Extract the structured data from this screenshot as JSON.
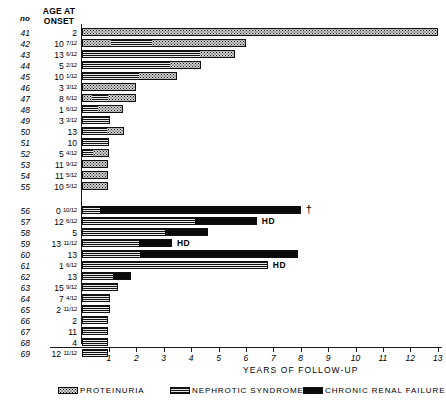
{
  "header": {
    "col_no": "no",
    "col_age_line1": "AGE AT",
    "col_age_line2": "ONSET"
  },
  "axis": {
    "title": "YEARS OF FOLLOW-UP",
    "ticks": [
      "1",
      "2",
      "3",
      "4",
      "5",
      "6",
      "7",
      "8",
      "9",
      "10",
      "11",
      "12",
      "13"
    ]
  },
  "legend": [
    {
      "key": "proteinuria",
      "label": "PROTEINURIA"
    },
    {
      "key": "nephrotic",
      "label": "NEPHROTIC SYNDROME"
    },
    {
      "key": "crf",
      "label": "CHRONIC RENAL FAILURE"
    }
  ],
  "rows": [
    {
      "no": "41",
      "age": "2",
      "frac": "",
      "note": ""
    },
    {
      "no": "42",
      "age": "10",
      "frac": "7/12",
      "note": ""
    },
    {
      "no": "43",
      "age": "13",
      "frac": "6/12",
      "note": ""
    },
    {
      "no": "44",
      "age": "5",
      "frac": "2/12",
      "note": ""
    },
    {
      "no": "45",
      "age": "10",
      "frac": "1/12",
      "note": ""
    },
    {
      "no": "46",
      "age": "3",
      "frac": "3/12",
      "note": ""
    },
    {
      "no": "47",
      "age": "8",
      "frac": "6/12",
      "note": ""
    },
    {
      "no": "48",
      "age": "1",
      "frac": "6/12",
      "note": ""
    },
    {
      "no": "49",
      "age": "3",
      "frac": "3/12",
      "note": ""
    },
    {
      "no": "50",
      "age": "13",
      "frac": "",
      "note": ""
    },
    {
      "no": "51",
      "age": "10",
      "frac": "",
      "note": ""
    },
    {
      "no": "52",
      "age": "5",
      "frac": "4/12",
      "note": ""
    },
    {
      "no": "53",
      "age": "11",
      "frac": "9/12",
      "note": ""
    },
    {
      "no": "54",
      "age": "11",
      "frac": "5/12",
      "note": ""
    },
    {
      "no": "55",
      "age": "10",
      "frac": "5/12",
      "note": ""
    },
    {
      "no": "56",
      "age": "0",
      "frac": "10/12",
      "note": "†"
    },
    {
      "no": "57",
      "age": "12",
      "frac": "6/12",
      "note": "HD"
    },
    {
      "no": "58",
      "age": "5",
      "frac": "",
      "note": ""
    },
    {
      "no": "59",
      "age": "13",
      "frac": "11/12",
      "note": "HD"
    },
    {
      "no": "60",
      "age": "13",
      "frac": "",
      "note": ""
    },
    {
      "no": "61",
      "age": "1",
      "frac": "6/12",
      "note": "HD"
    },
    {
      "no": "62",
      "age": "13",
      "frac": "",
      "note": ""
    },
    {
      "no": "63",
      "age": "15",
      "frac": "9/12",
      "note": ""
    },
    {
      "no": "64",
      "age": "7",
      "frac": "4/12",
      "note": ""
    },
    {
      "no": "65",
      "age": "2",
      "frac": "11/12",
      "note": ""
    },
    {
      "no": "66",
      "age": "2",
      "frac": "",
      "note": ""
    },
    {
      "no": "67",
      "age": "11",
      "frac": "",
      "note": ""
    },
    {
      "no": "68",
      "age": "4",
      "frac": "",
      "note": ""
    },
    {
      "no": "69",
      "age": "12",
      "frac": "11/12",
      "note": ""
    }
  ],
  "chart_data": {
    "type": "bar",
    "orientation": "horizontal",
    "stacked": true,
    "title": "",
    "xlabel": "YEARS OF FOLLOW-UP",
    "ylabel": "",
    "xlim": [
      0,
      13.2
    ],
    "xticks": [
      1,
      2,
      3,
      4,
      5,
      6,
      7,
      8,
      9,
      10,
      11,
      12,
      13
    ],
    "grid": false,
    "legend_position": "bottom",
    "categories": [
      "41",
      "42",
      "43",
      "44",
      "45",
      "46",
      "47",
      "48",
      "49",
      "50",
      "51",
      "52",
      "53",
      "54",
      "55",
      "56",
      "57",
      "58",
      "59",
      "60",
      "61",
      "62",
      "63",
      "64",
      "65",
      "66",
      "67",
      "68",
      "69"
    ],
    "stage_keys": [
      "proteinuria",
      "nephrotic",
      "crf"
    ],
    "stage_labels": [
      "PROTEINURIA",
      "NEPHROTIC SYNDROME",
      "CHRONIC RENAL FAILURE"
    ],
    "bars": [
      {
        "no": "41",
        "total": 13.0,
        "segments": [
          {
            "stage": "proteinuria",
            "start": 0,
            "end": 13.0
          }
        ]
      },
      {
        "no": "42",
        "total": 6.0,
        "segments": [
          {
            "stage": "proteinuria",
            "start": 0,
            "end": 1.05
          },
          {
            "stage": "nephrotic",
            "start": 1.05,
            "end": 2.55
          },
          {
            "stage": "proteinuria",
            "start": 2.55,
            "end": 6.0
          }
        ]
      },
      {
        "no": "43",
        "total": 5.6,
        "segments": [
          {
            "stage": "nephrotic",
            "start": 0,
            "end": 4.35
          },
          {
            "stage": "proteinuria",
            "start": 4.35,
            "end": 5.6
          }
        ]
      },
      {
        "no": "44",
        "total": 4.35,
        "segments": [
          {
            "stage": "nephrotic",
            "start": 0,
            "end": 3.25
          },
          {
            "stage": "proteinuria",
            "start": 3.25,
            "end": 4.35
          }
        ]
      },
      {
        "no": "45",
        "total": 3.5,
        "segments": [
          {
            "stage": "nephrotic",
            "start": 0,
            "end": 2.1
          },
          {
            "stage": "proteinuria",
            "start": 2.1,
            "end": 3.5
          }
        ]
      },
      {
        "no": "46",
        "total": 2.0,
        "segments": [
          {
            "stage": "proteinuria",
            "start": 0,
            "end": 2.0
          }
        ]
      },
      {
        "no": "47",
        "total": 2.0,
        "segments": [
          {
            "stage": "proteinuria",
            "start": 0,
            "end": 0.35
          },
          {
            "stage": "nephrotic",
            "start": 0.35,
            "end": 0.95
          },
          {
            "stage": "proteinuria",
            "start": 0.95,
            "end": 2.0
          }
        ]
      },
      {
        "no": "48",
        "total": 1.5,
        "segments": [
          {
            "stage": "nephrotic",
            "start": 0,
            "end": 0.6
          },
          {
            "stage": "proteinuria",
            "start": 0.6,
            "end": 1.5
          }
        ]
      },
      {
        "no": "49",
        "total": 1.05,
        "segments": [
          {
            "stage": "nephrotic",
            "start": 0,
            "end": 1.05
          }
        ]
      },
      {
        "no": "50",
        "total": 1.55,
        "segments": [
          {
            "stage": "nephrotic",
            "start": 0,
            "end": 0.95
          },
          {
            "stage": "proteinuria",
            "start": 0.95,
            "end": 1.55
          }
        ]
      },
      {
        "no": "51",
        "total": 1.0,
        "segments": [
          {
            "stage": "nephrotic",
            "start": 0,
            "end": 1.0
          }
        ]
      },
      {
        "no": "52",
        "total": 1.0,
        "segments": [
          {
            "stage": "nephrotic",
            "start": 0,
            "end": 0.4
          },
          {
            "stage": "proteinuria",
            "start": 0.4,
            "end": 1.0
          }
        ]
      },
      {
        "no": "53",
        "total": 0.95,
        "segments": [
          {
            "stage": "proteinuria",
            "start": 0,
            "end": 0.95
          }
        ]
      },
      {
        "no": "54",
        "total": 0.95,
        "segments": [
          {
            "stage": "proteinuria",
            "start": 0,
            "end": 0.95
          }
        ]
      },
      {
        "no": "55",
        "total": 0.95,
        "segments": [
          {
            "stage": "proteinuria",
            "start": 0,
            "end": 0.95
          }
        ]
      },
      {
        "no": "56",
        "total": 8.0,
        "segments": [
          {
            "stage": "nephrotic",
            "start": 0,
            "end": 0.65
          },
          {
            "stage": "crf",
            "start": 0.65,
            "end": 8.0
          }
        ],
        "annotation": "†"
      },
      {
        "no": "57",
        "total": 6.4,
        "segments": [
          {
            "stage": "nephrotic",
            "start": 0,
            "end": 4.15
          },
          {
            "stage": "crf",
            "start": 4.15,
            "end": 6.4
          }
        ],
        "annotation": "HD"
      },
      {
        "no": "58",
        "total": 4.6,
        "segments": [
          {
            "stage": "nephrotic",
            "start": 0,
            "end": 3.05
          },
          {
            "stage": "crf",
            "start": 3.05,
            "end": 4.6
          }
        ]
      },
      {
        "no": "59",
        "total": 3.3,
        "segments": [
          {
            "stage": "nephrotic",
            "start": 0,
            "end": 2.1
          },
          {
            "stage": "crf",
            "start": 2.1,
            "end": 3.3
          }
        ],
        "annotation": "HD"
      },
      {
        "no": "60",
        "total": 7.9,
        "segments": [
          {
            "stage": "nephrotic",
            "start": 0,
            "end": 2.1
          },
          {
            "stage": "crf",
            "start": 2.1,
            "end": 7.9
          }
        ],
        "annotation": "HD"
      },
      {
        "no": "61",
        "total": 6.8,
        "segments": [
          {
            "stage": "nephrotic",
            "start": 0,
            "end": 6.8
          }
        ]
      },
      {
        "no": "62",
        "total": 1.8,
        "segments": [
          {
            "stage": "nephrotic",
            "start": 0,
            "end": 1.15
          },
          {
            "stage": "crf",
            "start": 1.15,
            "end": 1.8
          }
        ]
      },
      {
        "no": "63",
        "total": 1.35,
        "segments": [
          {
            "stage": "nephrotic",
            "start": 0,
            "end": 1.35
          }
        ]
      },
      {
        "no": "64",
        "total": 1.05,
        "segments": [
          {
            "stage": "nephrotic",
            "start": 0,
            "end": 1.05
          }
        ]
      },
      {
        "no": "65",
        "total": 1.05,
        "segments": [
          {
            "stage": "nephrotic",
            "start": 0,
            "end": 1.05
          }
        ]
      },
      {
        "no": "66",
        "total": 0.95,
        "segments": [
          {
            "stage": "nephrotic",
            "start": 0,
            "end": 0.95
          }
        ]
      },
      {
        "no": "67",
        "total": 0.95,
        "segments": [
          {
            "stage": "nephrotic",
            "start": 0,
            "end": 0.95
          }
        ]
      },
      {
        "no": "68",
        "total": 0.95,
        "segments": [
          {
            "stage": "nephrotic",
            "start": 0,
            "end": 0.95
          }
        ]
      },
      {
        "no": "69",
        "total": 0.95,
        "segments": [
          {
            "stage": "nephrotic",
            "start": 0,
            "end": 0.95
          }
        ]
      }
    ]
  }
}
